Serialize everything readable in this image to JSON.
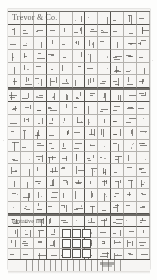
{
  "document": {
    "title": "Trevor & Co.",
    "section_label": "Tentative list",
    "sheet_background": "#f4f3f1",
    "rule_color": "#b4b2ae",
    "major_rule_color": "#55534f",
    "ink_color": "#5d5b57",
    "page_background": "#fdfdfc"
  },
  "layout": {
    "sections": [
      {
        "name": "upper-ledger",
        "top": 2,
        "height": 76,
        "rows": 6,
        "cols": 11
      },
      {
        "name": "middle-ledger",
        "top": 80,
        "height": 124,
        "rows": 10,
        "cols": 11
      },
      {
        "name": "lower-ledger",
        "top": 206,
        "height": 44,
        "rows": 4,
        "cols": 11
      }
    ],
    "totals_row": {
      "top": 250,
      "height": 12,
      "stripe_count": 17
    }
  },
  "checkboxes": {
    "count": 9,
    "columns": 3,
    "rows": 3,
    "origin_x": 62,
    "origin_y": 228,
    "size": 7,
    "gap": 3,
    "checked": [
      false,
      false,
      false,
      false,
      false,
      false,
      false,
      false,
      false
    ]
  },
  "marks": {
    "description": "faint handwritten ledger entries",
    "density": "dense",
    "glyph_hint": "tick-and-stroke"
  },
  "icons": {
    "checkbox": "checkbox-icon",
    "stamp": "ink-stamp-icon"
  }
}
